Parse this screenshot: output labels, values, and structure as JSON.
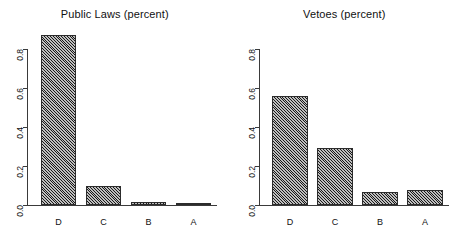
{
  "chart_data": [
    {
      "type": "bar",
      "title": "Public Laws (percent)",
      "xlabel": "",
      "ylabel": "",
      "categories": [
        "D",
        "C",
        "B",
        "A"
      ],
      "values": [
        0.87,
        0.1,
        0.015,
        0.012
      ],
      "ylim": [
        0.0,
        0.8
      ],
      "yticks": [
        "0.0",
        "0.2",
        "0.4",
        "0.6",
        "0.8"
      ],
      "ytick_values": [
        0.0,
        0.2,
        0.4,
        0.6,
        0.8
      ],
      "grid": false,
      "legend": "none"
    },
    {
      "type": "bar",
      "title": "Vetoes (percent)",
      "xlabel": "",
      "ylabel": "",
      "categories": [
        "D",
        "C",
        "B",
        "A"
      ],
      "values": [
        0.56,
        0.29,
        0.065,
        0.075
      ],
      "ylim": [
        0.0,
        0.8
      ],
      "yticks": [
        "0.0",
        "0.2",
        "0.4",
        "0.6",
        "0.8"
      ],
      "ytick_values": [
        0.0,
        0.2,
        0.4,
        0.6,
        0.8
      ],
      "grid": false,
      "legend": "none"
    }
  ],
  "colors": {
    "bar_fill": "#6e6e6e",
    "bar_edge": "#2c2c2c",
    "axis": "#3a3a3a",
    "text": "#111111",
    "background": "#ffffff"
  }
}
